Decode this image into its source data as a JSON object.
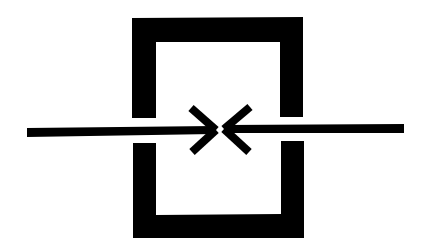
{
  "diagram": {
    "title": "Opposing arrows meeting inside a split rectangular frame",
    "background_color": "#ffffff",
    "ink_color": "#000000",
    "elements": {
      "frame": {
        "shape": "split-rectangle",
        "description": "Black rectangular frame split into top and bottom halves by a horizontal gap"
      },
      "left_arrow": {
        "direction": "right",
        "description": "Horizontal line from the left ending in a chevron arrowhead pointing right"
      },
      "right_arrow": {
        "direction": "left",
        "description": "Horizontal line from the right ending in a chevron arrowhead pointing left"
      },
      "meeting_point": {
        "description": "Two arrowheads meet at the center forming an X-like shape"
      }
    }
  }
}
